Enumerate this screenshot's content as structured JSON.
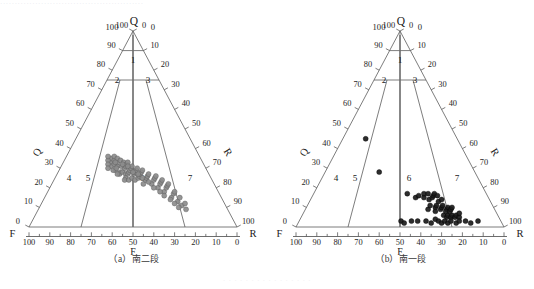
{
  "page": {
    "top_partial_text": "·················································",
    "bottom_partial_text": "· · · · · · · · · · · · · · · ·"
  },
  "panels": [
    {
      "id": "a",
      "caption_index": "（a）",
      "caption_text": "南二段",
      "apex_label": "Q",
      "apex_left_value": "100",
      "apex_right_value": "0",
      "left_axis_label": "Q",
      "right_axis_label": "R",
      "bottom_left_label": "F",
      "bottom_right_label": "R",
      "bottom_center_label": "F",
      "left_ticks": [
        "0",
        "10",
        "20",
        "30",
        "40",
        "50",
        "60",
        "70",
        "80",
        "90",
        "100"
      ],
      "right_ticks": [
        "0",
        "10",
        "20",
        "30",
        "40",
        "50",
        "60",
        "70",
        "80",
        "90",
        "100"
      ],
      "bottom_ticks": [
        "100",
        "90",
        "80",
        "70",
        "60",
        "50",
        "40",
        "30",
        "20",
        "10",
        "0"
      ],
      "regions": [
        "1",
        "2",
        "3",
        "4",
        "5",
        "6",
        "7"
      ],
      "point_color": "#7d7d7d"
    },
    {
      "id": "b",
      "caption_index": "（b）",
      "caption_text": "南一段",
      "apex_label": "Q",
      "apex_left_value": "100",
      "apex_right_value": "0",
      "left_axis_label": "Q",
      "right_axis_label": "R",
      "bottom_left_label": "F",
      "bottom_right_label": "R",
      "bottom_center_label": "F",
      "left_ticks": [
        "0",
        "10",
        "20",
        "30",
        "40",
        "50",
        "60",
        "70",
        "80",
        "90",
        "100"
      ],
      "right_ticks": [
        "0",
        "10",
        "20",
        "30",
        "40",
        "50",
        "60",
        "70",
        "80",
        "90",
        "100"
      ],
      "bottom_ticks": [
        "100",
        "90",
        "80",
        "70",
        "60",
        "50",
        "40",
        "30",
        "20",
        "10",
        "0"
      ],
      "regions": [
        "1",
        "2",
        "3",
        "4",
        "5",
        "6",
        "7"
      ],
      "point_color": "#1b1b1b"
    }
  ],
  "chart_data": {
    "type": "scatter",
    "title": "",
    "subplots": [
      {
        "name": "（a）南二段",
        "projection": "ternary",
        "axes": {
          "apex": "Q",
          "bottom_left_vertex": "F",
          "bottom_right_vertex": "R",
          "bottom_axis_label": "F",
          "left_axis_label": "Q",
          "right_axis_label": "R",
          "bottom_range": [
            100,
            0
          ],
          "left_range": [
            0,
            100
          ],
          "right_range": [
            0,
            100
          ],
          "tick_step": 10,
          "grid": false
        },
        "classification_fields": [
          {
            "label": "1",
            "name": "石英砂岩区"
          },
          {
            "label": "2",
            "name": "亚岩屑砂岩区左"
          },
          {
            "label": "3",
            "name": "亚岩屑砂岩区右"
          },
          {
            "label": "4",
            "name": "长石砂岩区"
          },
          {
            "label": "5",
            "name": "岩屑长石砂岩区"
          },
          {
            "label": "6",
            "name": "长石岩屑砂岩区"
          },
          {
            "label": "7",
            "name": "岩屑砂岩区"
          }
        ],
        "marker": {
          "shape": "circle",
          "fill": "#8c8c8c",
          "edge": "#555555",
          "size": 2.5
        },
        "points_FQR": [
          [
            44,
            33,
            23
          ],
          [
            43,
            35,
            22
          ],
          [
            42,
            34,
            24
          ],
          [
            41,
            36,
            23
          ],
          [
            45,
            31,
            24
          ],
          [
            43,
            32,
            25
          ],
          [
            42,
            31,
            27
          ],
          [
            44,
            29,
            27
          ],
          [
            41,
            33,
            26
          ],
          [
            40,
            35,
            25
          ],
          [
            39,
            34,
            27
          ],
          [
            38,
            33,
            29
          ],
          [
            40,
            31,
            29
          ],
          [
            42,
            28,
            30
          ],
          [
            43,
            27,
            30
          ],
          [
            41,
            28,
            31
          ],
          [
            39,
            30,
            31
          ],
          [
            38,
            31,
            31
          ],
          [
            37,
            32,
            31
          ],
          [
            36,
            33,
            31
          ],
          [
            40,
            27,
            33
          ],
          [
            39,
            27,
            34
          ],
          [
            38,
            28,
            34
          ],
          [
            37,
            29,
            34
          ],
          [
            36,
            30,
            34
          ],
          [
            35,
            31,
            34
          ],
          [
            41,
            25,
            34
          ],
          [
            42,
            24,
            34
          ],
          [
            40,
            24,
            36
          ],
          [
            38,
            25,
            37
          ],
          [
            36,
            27,
            37
          ],
          [
            35,
            28,
            37
          ],
          [
            34,
            29,
            37
          ],
          [
            33,
            30,
            37
          ],
          [
            37,
            24,
            39
          ],
          [
            35,
            25,
            40
          ],
          [
            34,
            26,
            40
          ],
          [
            33,
            27,
            40
          ],
          [
            32,
            28,
            40
          ],
          [
            31,
            29,
            40
          ],
          [
            34,
            22,
            44
          ],
          [
            32,
            24,
            44
          ],
          [
            31,
            25,
            44
          ],
          [
            30,
            26,
            44
          ],
          [
            29,
            27,
            44
          ],
          [
            30,
            22,
            48
          ],
          [
            28,
            24,
            48
          ],
          [
            27,
            25,
            48
          ],
          [
            26,
            26,
            48
          ],
          [
            28,
            20,
            52
          ],
          [
            26,
            22,
            52
          ],
          [
            25,
            23,
            52
          ],
          [
            24,
            24,
            52
          ],
          [
            26,
            18,
            56
          ],
          [
            24,
            20,
            56
          ],
          [
            23,
            21,
            56
          ],
          [
            22,
            22,
            56
          ],
          [
            24,
            15,
            61
          ],
          [
            22,
            17,
            61
          ],
          [
            21,
            18,
            61
          ],
          [
            22,
            13,
            65
          ],
          [
            20,
            15,
            65
          ],
          [
            21,
            11,
            68
          ],
          [
            19,
            12,
            69
          ],
          [
            20,
            9,
            71
          ],
          [
            45,
            34,
            21
          ],
          [
            46,
            32,
            22
          ],
          [
            47,
            30,
            23
          ],
          [
            44,
            36,
            20
          ],
          [
            45,
            29,
            26
          ],
          [
            43,
            30,
            27
          ],
          [
            44,
            27,
            29
          ],
          [
            42,
            33,
            25
          ],
          [
            39,
            32,
            29
          ],
          [
            37,
            31,
            32
          ],
          [
            36,
            28,
            36
          ],
          [
            34,
            27,
            39
          ],
          [
            33,
            25,
            42
          ],
          [
            31,
            23,
            46
          ],
          [
            30,
            20,
            50
          ],
          [
            28,
            18,
            54
          ],
          [
            27,
            16,
            57
          ],
          [
            25,
            14,
            61
          ],
          [
            24,
            12,
            64
          ],
          [
            23,
            10,
            67
          ]
        ]
      },
      {
        "name": "（b）南一段",
        "projection": "ternary",
        "axes": {
          "apex": "Q",
          "bottom_left_vertex": "F",
          "bottom_right_vertex": "R",
          "bottom_axis_label": "F",
          "left_axis_label": "Q",
          "right_axis_label": "R",
          "bottom_range": [
            100,
            0
          ],
          "left_range": [
            0,
            100
          ],
          "right_range": [
            0,
            100
          ],
          "tick_step": 10,
          "grid": false
        },
        "classification_fields": [
          {
            "label": "1",
            "name": "石英砂岩区"
          },
          {
            "label": "2",
            "name": "亚岩屑砂岩区左"
          },
          {
            "label": "3",
            "name": "亚岩屑砂岩区右"
          },
          {
            "label": "4",
            "name": "长石砂岩区"
          },
          {
            "label": "5",
            "name": "岩屑长石砂岩区"
          },
          {
            "label": "6",
            "name": "长石岩屑砂岩区"
          },
          {
            "label": "7",
            "name": "岩屑砂岩区"
          }
        ],
        "marker": {
          "shape": "circle",
          "fill": "#1b1b1b",
          "edge": "#000000",
          "size": 2.5
        },
        "points_FQR": [
          [
            44,
            45,
            11
          ],
          [
            46,
            28,
            26
          ],
          [
            38,
            17,
            45
          ],
          [
            35,
            15,
            50
          ],
          [
            33,
            16,
            51
          ],
          [
            31,
            15,
            54
          ],
          [
            30,
            17,
            53
          ],
          [
            29,
            14,
            57
          ],
          [
            28,
            17,
            55
          ],
          [
            27,
            15,
            58
          ],
          [
            26,
            16,
            58
          ],
          [
            25,
            17,
            58
          ],
          [
            24,
            16,
            60
          ],
          [
            28,
            10,
            62
          ],
          [
            27,
            11,
            62
          ],
          [
            26,
            9,
            65
          ],
          [
            25,
            10,
            65
          ],
          [
            24,
            11,
            65
          ],
          [
            23,
            9,
            68
          ],
          [
            22,
            10,
            68
          ],
          [
            26,
            6,
            68
          ],
          [
            25,
            5,
            70
          ],
          [
            24,
            6,
            70
          ],
          [
            23,
            5,
            72
          ],
          [
            22,
            6,
            72
          ],
          [
            21,
            5,
            74
          ],
          [
            20,
            6,
            74
          ],
          [
            19,
            5,
            76
          ],
          [
            48,
            3,
            49
          ],
          [
            47,
            2,
            51
          ],
          [
            43,
            3,
            54
          ],
          [
            40,
            3,
            57
          ],
          [
            36,
            3,
            61
          ],
          [
            34,
            2,
            64
          ],
          [
            31,
            4,
            65
          ],
          [
            30,
            3,
            67
          ],
          [
            29,
            2,
            69
          ],
          [
            27,
            3,
            70
          ],
          [
            26,
            2,
            72
          ],
          [
            24,
            3,
            73
          ],
          [
            22,
            2,
            76
          ],
          [
            20,
            3,
            77
          ],
          [
            17,
            3,
            80
          ],
          [
            15,
            2,
            83
          ],
          [
            11,
            3,
            86
          ],
          [
            32,
            9,
            59
          ],
          [
            30,
            11,
            59
          ],
          [
            29,
            8,
            63
          ],
          [
            25,
            13,
            62
          ],
          [
            23,
            14,
            63
          ],
          [
            24,
            8,
            68
          ],
          [
            22,
            8,
            70
          ],
          [
            21,
            9,
            70
          ],
          [
            20,
            10,
            70
          ],
          [
            18,
            7,
            75
          ]
        ]
      }
    ]
  }
}
